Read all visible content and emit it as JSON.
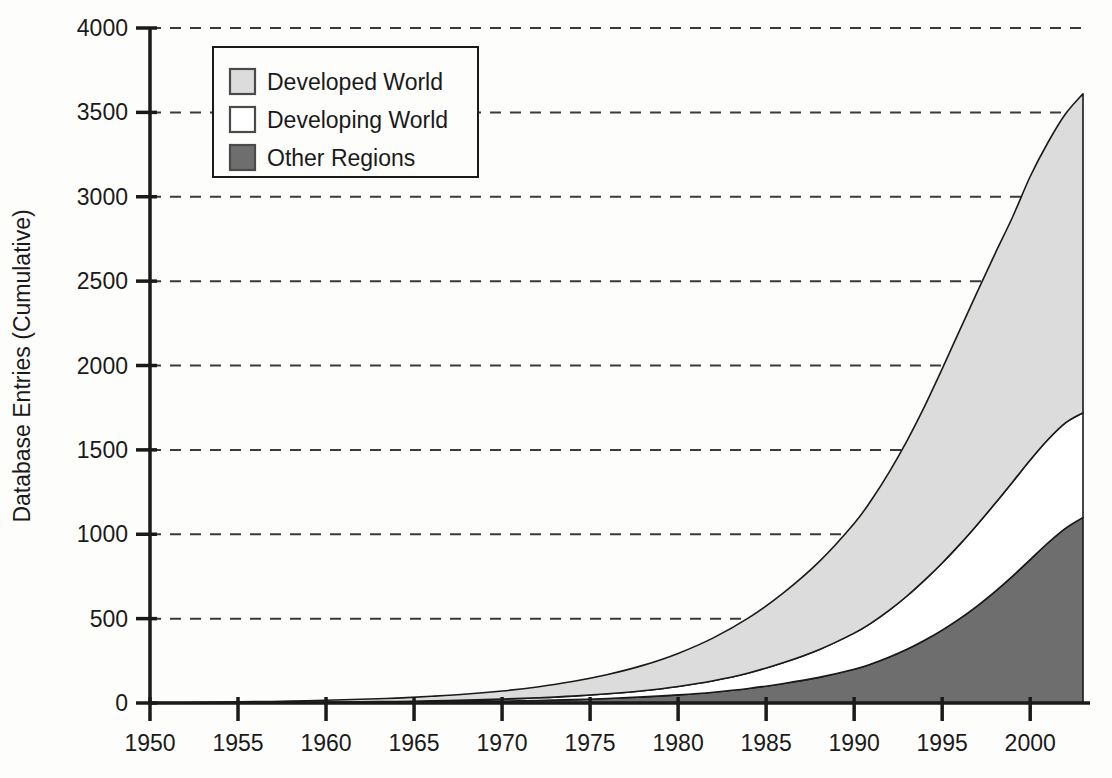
{
  "chart_data": {
    "type": "area",
    "stacked": true,
    "title": "",
    "xlabel": "",
    "ylabel": "Database Entries (Cumulative)",
    "xlim": [
      1950,
      2003
    ],
    "ylim": [
      0,
      4000
    ],
    "grid": true,
    "grid_style": "dashed-horizontal",
    "legend_position": "upper-left-inside",
    "xticks": [
      1950,
      1955,
      1960,
      1965,
      1970,
      1975,
      1980,
      1985,
      1990,
      1995,
      2000
    ],
    "xtick_labels": [
      "1950",
      "1955",
      "1960",
      "1965",
      "1970",
      "1975",
      "1980",
      "1985",
      "1990",
      "1995",
      "2000"
    ],
    "yticks": [
      0,
      500,
      1000,
      1500,
      2000,
      2500,
      3000,
      3500,
      4000
    ],
    "ytick_labels": [
      "0",
      "500",
      "1000",
      "1500",
      "2000",
      "2500",
      "3000",
      "3500",
      "4000"
    ],
    "x": [
      1950,
      1952,
      1954,
      1956,
      1958,
      1960,
      1962,
      1964,
      1966,
      1968,
      1970,
      1972,
      1974,
      1976,
      1978,
      1980,
      1982,
      1984,
      1986,
      1988,
      1990,
      1991,
      1992,
      1993,
      1994,
      1995,
      1996,
      1997,
      1998,
      1999,
      2000,
      2001,
      2002,
      2003
    ],
    "series": [
      {
        "name": "Other Regions",
        "color": "#6e6e6e",
        "stack_order": 1,
        "values": [
          0,
          0,
          0,
          1,
          1,
          2,
          3,
          4,
          6,
          8,
          11,
          15,
          20,
          27,
          36,
          48,
          64,
          86,
          116,
          152,
          200,
          232,
          272,
          318,
          372,
          432,
          500,
          576,
          660,
          752,
          850,
          948,
          1035,
          1100
        ]
      },
      {
        "name": "Developing World",
        "color": "#ffffff",
        "stack_order": 2,
        "values": [
          0,
          0,
          1,
          1,
          2,
          3,
          4,
          5,
          7,
          9,
          12,
          16,
          21,
          28,
          37,
          50,
          68,
          92,
          124,
          164,
          214,
          244,
          278,
          316,
          356,
          398,
          440,
          482,
          522,
          558,
          590,
          612,
          625,
          620
        ]
      },
      {
        "name": "Developed World",
        "color": "#dcdcdc",
        "stack_order": 3,
        "values": [
          2,
          3,
          4,
          6,
          8,
          11,
          15,
          20,
          27,
          36,
          48,
          64,
          86,
          114,
          150,
          196,
          254,
          326,
          414,
          520,
          650,
          730,
          820,
          920,
          1030,
          1150,
          1270,
          1380,
          1480,
          1570,
          1680,
          1760,
          1830,
          1890
        ]
      }
    ],
    "stacked_totals_note": "top boundary = sum of three series",
    "final_year_values": {
      "year": 2003,
      "other_regions": 1100,
      "developing_world_top": 1720,
      "total": 3610
    }
  },
  "legend": {
    "items": [
      {
        "label": "Developed World",
        "swatch": "light-gray-swatch",
        "color": "#dcdcdc"
      },
      {
        "label": "Developing World",
        "swatch": "white-swatch",
        "color": "#ffffff"
      },
      {
        "label": "Other Regions",
        "swatch": "dark-gray-swatch",
        "color": "#6e6e6e"
      }
    ]
  },
  "axes": {
    "y_title": "Database Entries (Cumulative)"
  },
  "colors": {
    "developed": "#dcdcdc",
    "developing": "#ffffff",
    "other": "#6e6e6e",
    "axis": "#1a1a1a",
    "grid": "#3a3a3a",
    "background": "#fdfdfb"
  }
}
